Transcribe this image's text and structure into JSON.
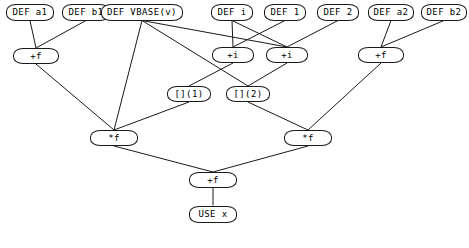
{
  "diagram": {
    "background_color": "#ffffff",
    "node_fill": "#ffffff",
    "node_stroke": "#1a1a1a",
    "edge_color": "#1a1a1a",
    "width": 469,
    "height": 248,
    "nodes": [
      {
        "id": "def_a1",
        "label": "DEF a1",
        "x": 30,
        "y": 12,
        "w": 48,
        "h": 17,
        "font_size": 9
      },
      {
        "id": "def_b1",
        "label": "DEF b1",
        "x": 86,
        "y": 12,
        "w": 48,
        "h": 17,
        "font_size": 9
      },
      {
        "id": "def_vbase",
        "label": "DEF VBASE(v)",
        "x": 142,
        "y": 12,
        "w": 82,
        "h": 17,
        "font_size": 9
      },
      {
        "id": "def_i",
        "label": "DEF i",
        "x": 232,
        "y": 12,
        "w": 42,
        "h": 17,
        "font_size": 9
      },
      {
        "id": "def_1",
        "label": "DEF 1",
        "x": 285,
        "y": 12,
        "w": 42,
        "h": 17,
        "font_size": 9
      },
      {
        "id": "def_2",
        "label": "DEF 2",
        "x": 338,
        "y": 12,
        "w": 42,
        "h": 17,
        "font_size": 9
      },
      {
        "id": "def_a2",
        "label": "DEF a2",
        "x": 391,
        "y": 12,
        "w": 46,
        "h": 17,
        "font_size": 9
      },
      {
        "id": "def_b2",
        "label": "DEF b2",
        "x": 444,
        "y": 12,
        "w": 46,
        "h": 17,
        "font_size": 9
      },
      {
        "id": "plus_f_l",
        "label": "+f",
        "x": 36,
        "y": 56,
        "w": 46,
        "h": 16,
        "font_size": 9
      },
      {
        "id": "plus_i_1",
        "label": "+i",
        "x": 233,
        "y": 55,
        "w": 42,
        "h": 16,
        "font_size": 9
      },
      {
        "id": "plus_i_2",
        "label": "+i",
        "x": 287,
        "y": 55,
        "w": 42,
        "h": 16,
        "font_size": 9
      },
      {
        "id": "plus_f_r",
        "label": "+f",
        "x": 381,
        "y": 55,
        "w": 46,
        "h": 16,
        "font_size": 9
      },
      {
        "id": "idx_1",
        "label": "[](1)",
        "x": 189,
        "y": 94,
        "w": 44,
        "h": 16,
        "font_size": 9
      },
      {
        "id": "idx_2",
        "label": "[](2)",
        "x": 248,
        "y": 94,
        "w": 44,
        "h": 16,
        "font_size": 9
      },
      {
        "id": "mul_f_l",
        "label": "*f",
        "x": 114,
        "y": 138,
        "w": 48,
        "h": 16,
        "font_size": 9
      },
      {
        "id": "mul_f_r",
        "label": "*f",
        "x": 308,
        "y": 138,
        "w": 48,
        "h": 16,
        "font_size": 9
      },
      {
        "id": "plus_f_b",
        "label": "+f",
        "x": 213,
        "y": 180,
        "w": 48,
        "h": 16,
        "font_size": 9
      },
      {
        "id": "use_x",
        "label": "USE x",
        "x": 213,
        "y": 214,
        "w": 48,
        "h": 17,
        "font_size": 9
      }
    ],
    "edges": [
      {
        "from": "def_a1",
        "to": "plus_f_l"
      },
      {
        "from": "def_b1",
        "to": "plus_f_l"
      },
      {
        "from": "def_vbase",
        "to": "idx_2"
      },
      {
        "from": "def_vbase",
        "to": "mul_f_l"
      },
      {
        "from": "def_vbase",
        "to": "plus_i_2"
      },
      {
        "from": "def_i",
        "to": "plus_i_1"
      },
      {
        "from": "def_i",
        "to": "plus_i_2"
      },
      {
        "from": "def_1",
        "to": "plus_i_1"
      },
      {
        "from": "def_2",
        "to": "plus_i_2"
      },
      {
        "from": "def_a2",
        "to": "plus_f_r"
      },
      {
        "from": "def_b2",
        "to": "plus_f_r"
      },
      {
        "from": "plus_i_1",
        "to": "idx_1"
      },
      {
        "from": "plus_i_2",
        "to": "idx_2"
      },
      {
        "from": "plus_f_l",
        "to": "mul_f_l"
      },
      {
        "from": "plus_f_r",
        "to": "mul_f_r"
      },
      {
        "from": "idx_1",
        "to": "mul_f_l"
      },
      {
        "from": "idx_2",
        "to": "mul_f_r"
      },
      {
        "from": "mul_f_l",
        "to": "plus_f_b"
      },
      {
        "from": "mul_f_r",
        "to": "plus_f_b"
      },
      {
        "from": "plus_f_b",
        "to": "use_x"
      }
    ]
  }
}
